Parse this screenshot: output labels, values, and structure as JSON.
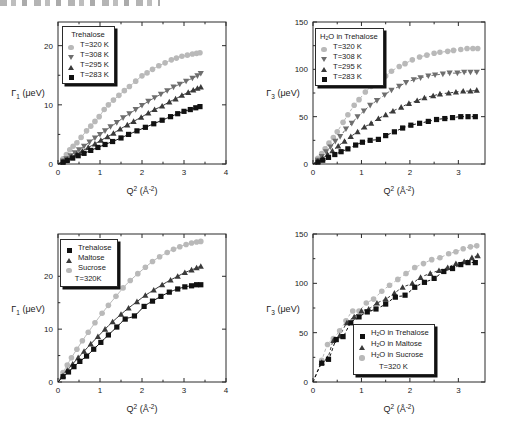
{
  "figure": {
    "header_artifact": "scan-edge-text",
    "panel_count": 4
  },
  "colors": {
    "c283": "#111111",
    "c295": "#3a3a3a",
    "c308": "#6e6e6e",
    "c320": "#b9b9b9",
    "axis": "#2a2a2a",
    "trehalose": "#111111",
    "maltose": "#3a3a3a",
    "sucrose": "#b9b9b9"
  },
  "axis_labels": {
    "x": "Q² (Å⁻²)",
    "x_base": "Q",
    "x_sup": "2",
    "x_unit_open": " (Å",
    "x_unit_sup": "-2",
    "x_unit_close": ")",
    "y_gamma1": "Γ₁ (μeV)",
    "y_gamma3": "Γ₃ (μeV)",
    "y_gamma_base": "Γ",
    "y_sub_1": "1",
    "y_sub_3": "3",
    "y_unit": " (μeV)"
  },
  "chart_data": [
    {
      "id": "panel-top-left",
      "type": "scatter",
      "title": "",
      "xlabel": "Q² (Å⁻²)",
      "ylabel": "Γ₁ (μeV)",
      "xlim": [
        0,
        4
      ],
      "ylim": [
        0,
        24
      ],
      "xticks": [
        0,
        1,
        2,
        3,
        4
      ],
      "yticks": [
        0,
        10,
        20
      ],
      "grid": false,
      "fit_style": "solid",
      "legend_position": "top-left",
      "legend_title": "Trehalose",
      "series": [
        {
          "name": "T=320 K",
          "marker": "circle",
          "color": "#b9b9b9",
          "x": [
            0.12,
            0.2,
            0.28,
            0.36,
            0.45,
            0.55,
            0.68,
            0.78,
            0.88,
            0.98,
            1.1,
            1.2,
            1.32,
            1.45,
            1.58,
            1.7,
            1.85,
            2.0,
            2.12,
            2.25,
            2.4,
            2.55,
            2.7,
            2.82,
            2.95,
            3.08,
            3.2,
            3.3,
            3.38
          ],
          "y": [
            0.9,
            1.6,
            2.4,
            3.0,
            3.6,
            4.5,
            5.6,
            6.4,
            7.2,
            8.0,
            9.2,
            10.0,
            10.8,
            11.6,
            12.4,
            13.1,
            14.0,
            14.9,
            15.4,
            16.0,
            16.6,
            17.1,
            17.6,
            17.9,
            18.2,
            18.4,
            18.6,
            18.7,
            18.8
          ]
        },
        {
          "name": "T=308 K",
          "marker": "dtriangle",
          "color": "#6e6e6e",
          "x": [
            0.12,
            0.2,
            0.3,
            0.4,
            0.5,
            0.62,
            0.75,
            0.88,
            1.0,
            1.12,
            1.25,
            1.4,
            1.55,
            1.7,
            1.85,
            2.0,
            2.15,
            2.3,
            2.45,
            2.6,
            2.75,
            2.9,
            3.05,
            3.2,
            3.32,
            3.4
          ],
          "y": [
            0.5,
            0.9,
            1.4,
            1.9,
            2.4,
            3.0,
            3.7,
            4.4,
            5.0,
            5.6,
            6.3,
            7.0,
            7.8,
            8.5,
            9.2,
            9.9,
            10.6,
            11.2,
            11.8,
            12.4,
            13.0,
            13.5,
            14.0,
            14.5,
            14.9,
            15.3
          ]
        },
        {
          "name": "T=295 K",
          "marker": "utriangle",
          "color": "#3a3a3a",
          "x": [
            0.12,
            0.22,
            0.32,
            0.45,
            0.58,
            0.72,
            0.88,
            1.02,
            1.18,
            1.32,
            1.48,
            1.65,
            1.8,
            1.98,
            2.15,
            2.3,
            2.48,
            2.65,
            2.8,
            2.95,
            3.1,
            3.22,
            3.32,
            3.4
          ],
          "y": [
            0.4,
            0.8,
            1.2,
            1.7,
            2.2,
            2.8,
            3.4,
            4.0,
            4.6,
            5.2,
            5.9,
            6.6,
            7.2,
            7.9,
            8.6,
            9.2,
            9.8,
            10.5,
            11.0,
            11.6,
            12.1,
            12.5,
            12.8,
            13.0
          ]
        },
        {
          "name": "T=283 K",
          "marker": "square",
          "color": "#111111",
          "x": [
            0.12,
            0.22,
            0.35,
            0.48,
            0.62,
            0.78,
            0.95,
            1.12,
            1.3,
            1.5,
            1.68,
            1.88,
            2.08,
            2.28,
            2.48,
            2.68,
            2.85,
            3.0,
            3.15,
            3.28,
            3.38
          ],
          "y": [
            0.3,
            0.6,
            1.0,
            1.4,
            1.8,
            2.3,
            2.8,
            3.3,
            3.8,
            4.4,
            5.0,
            5.6,
            6.2,
            6.8,
            7.4,
            8.0,
            8.5,
            8.9,
            9.2,
            9.5,
            9.7
          ]
        }
      ]
    },
    {
      "id": "panel-top-right",
      "type": "scatter",
      "title": "",
      "xlabel": "Q² (Å⁻²)",
      "ylabel": "Γ₃ (μeV)",
      "xlim": [
        0,
        3.55
      ],
      "ylim": [
        0,
        150
      ],
      "xticks": [
        0,
        1,
        2,
        3
      ],
      "yticks": [
        0,
        50,
        100,
        150
      ],
      "grid": false,
      "fit_style": "dashed",
      "legend_position": "top-left",
      "legend_title": "H₂O in Trehalose",
      "series": [
        {
          "name": "T=320 K",
          "marker": "circle",
          "color": "#b9b9b9",
          "x": [
            0.1,
            0.18,
            0.25,
            0.33,
            0.42,
            0.5,
            0.62,
            0.72,
            0.85,
            0.95,
            1.08,
            1.2,
            1.35,
            1.5,
            1.62,
            1.78,
            1.9,
            2.05,
            2.2,
            2.35,
            2.5,
            2.62,
            2.78,
            2.9,
            3.05,
            3.18,
            3.3,
            3.4
          ],
          "y": [
            6,
            11,
            16,
            22,
            28,
            34,
            44,
            52,
            62,
            68,
            76,
            82,
            88,
            93,
            98,
            103,
            106,
            110,
            113,
            115,
            117,
            118,
            119,
            120,
            121,
            122,
            122,
            122
          ]
        },
        {
          "name": "T=308 K",
          "marker": "dtriangle",
          "color": "#6e6e6e",
          "x": [
            0.1,
            0.18,
            0.27,
            0.36,
            0.46,
            0.56,
            0.68,
            0.8,
            0.92,
            1.05,
            1.18,
            1.32,
            1.48,
            1.62,
            1.78,
            1.92,
            2.08,
            2.22,
            2.38,
            2.52,
            2.68,
            2.82,
            2.98,
            3.12,
            3.25,
            3.38
          ],
          "y": [
            4,
            8,
            13,
            18,
            24,
            29,
            37,
            43,
            50,
            56,
            62,
            67,
            73,
            78,
            82,
            86,
            89,
            91,
            93,
            94,
            95,
            96,
            96,
            97,
            97,
            97
          ]
        },
        {
          "name": "T=295 K",
          "marker": "utriangle",
          "color": "#3a3a3a",
          "x": [
            0.1,
            0.2,
            0.3,
            0.4,
            0.52,
            0.65,
            0.78,
            0.92,
            1.06,
            1.2,
            1.35,
            1.5,
            1.65,
            1.82,
            1.98,
            2.15,
            2.3,
            2.48,
            2.62,
            2.8,
            2.95,
            3.1,
            3.25,
            3.38
          ],
          "y": [
            3,
            6,
            10,
            14,
            19,
            24,
            29,
            34,
            39,
            43,
            48,
            52,
            56,
            60,
            64,
            67,
            70,
            72,
            74,
            75,
            76,
            77,
            77,
            78
          ]
        },
        {
          "name": "T=283 K",
          "marker": "square",
          "color": "#111111",
          "x": [
            0.1,
            0.2,
            0.32,
            0.45,
            0.58,
            0.72,
            0.88,
            1.02,
            1.18,
            1.35,
            1.5,
            1.68,
            1.85,
            2.02,
            2.2,
            2.38,
            2.55,
            2.72,
            2.88,
            3.05,
            3.2,
            3.35
          ],
          "y": [
            2,
            4,
            7,
            10,
            13,
            16,
            20,
            23,
            25,
            26,
            30,
            34,
            38,
            41,
            43,
            45,
            47,
            48,
            49,
            50,
            50,
            50
          ]
        }
      ]
    },
    {
      "id": "panel-bottom-left",
      "type": "scatter",
      "title": "",
      "xlabel": "Q² (Å⁻²)",
      "ylabel": "Γ₁ (μeV)",
      "xlim": [
        0,
        4
      ],
      "ylim": [
        0,
        28
      ],
      "xticks": [
        0,
        1,
        2,
        3,
        4
      ],
      "yticks": [
        0,
        10,
        20
      ],
      "grid": false,
      "fit_style": "solid",
      "legend_position": "top-left",
      "legend_footer": "T=320K",
      "series": [
        {
          "name": "Sucrose",
          "marker": "circle",
          "color": "#b9b9b9",
          "x": [
            0.12,
            0.22,
            0.32,
            0.45,
            0.58,
            0.72,
            0.88,
            1.05,
            1.2,
            1.38,
            1.55,
            1.72,
            1.9,
            2.08,
            2.25,
            2.42,
            2.6,
            2.75,
            2.9,
            3.05,
            3.18,
            3.3,
            3.4
          ],
          "y": [
            1.8,
            3.2,
            4.6,
            6.2,
            7.8,
            9.4,
            11.2,
            13.0,
            14.5,
            16.2,
            17.8,
            19.2,
            20.5,
            21.7,
            22.8,
            23.7,
            24.5,
            25.1,
            25.6,
            26.0,
            26.3,
            26.5,
            26.6
          ]
        },
        {
          "name": "Maltose",
          "marker": "utriangle",
          "color": "#3a3a3a",
          "x": [
            0.12,
            0.22,
            0.35,
            0.48,
            0.62,
            0.78,
            0.95,
            1.12,
            1.3,
            1.5,
            1.68,
            1.88,
            2.08,
            2.28,
            2.48,
            2.68,
            2.85,
            3.02,
            3.18,
            3.3,
            3.4
          ],
          "y": [
            1.2,
            2.2,
            3.4,
            4.6,
            5.8,
            7.2,
            8.6,
            10.0,
            11.4,
            12.8,
            14.0,
            15.2,
            16.4,
            17.4,
            18.4,
            19.3,
            20.0,
            20.7,
            21.2,
            21.6,
            21.9
          ]
        },
        {
          "name": "Trehalose",
          "marker": "square",
          "color": "#111111",
          "x": [
            0.12,
            0.25,
            0.38,
            0.52,
            0.68,
            0.85,
            1.02,
            1.2,
            1.4,
            1.6,
            1.82,
            2.05,
            2.25,
            2.45,
            2.65,
            2.85,
            3.02,
            3.18,
            3.3,
            3.4
          ],
          "y": [
            1.0,
            1.9,
            2.9,
            3.9,
            4.9,
            6.2,
            7.5,
            8.9,
            10.4,
            11.9,
            12.5,
            14.3,
            15.3,
            16.2,
            17.0,
            17.6,
            18.0,
            18.2,
            18.4,
            18.4
          ]
        }
      ]
    },
    {
      "id": "panel-bottom-right",
      "type": "scatter",
      "title": "",
      "xlabel": "Q² (Å⁻²)",
      "ylabel": "Γ₃ (μeV)",
      "xlim": [
        0,
        3.55
      ],
      "ylim": [
        0,
        150
      ],
      "xticks": [
        0,
        1,
        2,
        3
      ],
      "yticks": [
        0,
        50,
        100,
        150
      ],
      "grid": false,
      "fit_style": "dashed",
      "legend_position": "bottom-right",
      "legend_footer": "T=320 K",
      "series": [
        {
          "name": "H₂O in Sucrose",
          "marker": "circle",
          "color": "#b9b9b9",
          "x": [
            0.18,
            0.3,
            0.42,
            0.55,
            0.68,
            0.82,
            0.95,
            1.1,
            1.25,
            1.42,
            1.58,
            1.75,
            1.92,
            2.1,
            2.28,
            2.45,
            2.62,
            2.8,
            2.95,
            3.1,
            3.25,
            3.38
          ],
          "y": [
            22,
            38,
            44,
            52,
            62,
            72,
            72,
            80,
            84,
            92,
            98,
            104,
            110,
            116,
            120,
            124,
            126,
            130,
            132,
            135,
            137,
            138
          ]
        },
        {
          "name": "H₂O in Maltose",
          "marker": "utriangle",
          "color": "#3a3a3a",
          "x": [
            0.18,
            0.3,
            0.42,
            0.55,
            0.7,
            0.85,
            1.0,
            1.15,
            1.32,
            1.5,
            1.68,
            1.85,
            2.05,
            2.22,
            2.42,
            2.6,
            2.78,
            2.95,
            3.12,
            3.28,
            3.4
          ],
          "y": [
            20,
            24,
            42,
            47,
            60,
            66,
            72,
            74,
            80,
            84,
            90,
            96,
            100,
            106,
            110,
            113,
            116,
            120,
            122,
            126,
            128
          ]
        },
        {
          "name": "H₂O in Trehalose",
          "marker": "square",
          "color": "#111111",
          "x": [
            0.18,
            0.32,
            0.48,
            0.62,
            0.78,
            0.95,
            1.12,
            1.3,
            1.5,
            1.7,
            1.9,
            2.1,
            2.3,
            2.5,
            2.7,
            2.88,
            3.05,
            3.2,
            3.35
          ],
          "y": [
            19,
            23,
            43,
            46,
            60,
            66,
            71,
            74,
            79,
            86,
            88,
            96,
            101,
            105,
            112,
            115,
            119,
            121,
            121
          ]
        }
      ]
    }
  ],
  "panels": {
    "top_left": {
      "legend": {
        "title": "Trehalose",
        "rows": [
          {
            "marker": "circle",
            "label": "T=320 K"
          },
          {
            "marker": "dtriangle",
            "label": "T=308 K"
          },
          {
            "marker": "utriangle",
            "label": "T=295 K"
          },
          {
            "marker": "square",
            "label": "T=283 K"
          }
        ]
      },
      "yticks": [
        "0",
        "10",
        "20"
      ],
      "xticks": [
        "0",
        "1",
        "2",
        "3",
        "4"
      ]
    },
    "top_right": {
      "legend": {
        "title_pre": "H",
        "title_sub": "2",
        "title_post": "O in Trehalose",
        "title": "H₂O in Trehalose",
        "rows": [
          {
            "marker": "circle",
            "label": "T=320 K"
          },
          {
            "marker": "dtriangle",
            "label": "T=308 K"
          },
          {
            "marker": "utriangle",
            "label": "T=295 K"
          },
          {
            "marker": "square",
            "label": "T=283 K"
          }
        ]
      },
      "yticks": [
        "0",
        "50",
        "100",
        "150"
      ],
      "xticks": [
        "0",
        "1",
        "2",
        "3"
      ]
    },
    "bottom_left": {
      "legend": {
        "rows": [
          {
            "marker": "square",
            "label": "Trehalose"
          },
          {
            "marker": "utriangle",
            "label": "Maltose"
          },
          {
            "marker": "circle",
            "label": "Sucrose"
          }
        ],
        "footer": "T=320K"
      },
      "yticks": [
        "0",
        "10",
        "20"
      ],
      "xticks": [
        "0",
        "1",
        "2",
        "3",
        "4"
      ]
    },
    "bottom_right": {
      "legend": {
        "rows": [
          {
            "marker": "square",
            "label_pre": "H",
            "label_sub": "2",
            "label_post": "O in Trehalose",
            "label": "H₂O in Trehalose"
          },
          {
            "marker": "utriangle",
            "label_pre": "H",
            "label_sub": "2",
            "label_post": "O in Maltose",
            "label": "H₂O in Maltose"
          },
          {
            "marker": "circle",
            "label_pre": "H",
            "label_sub": "2",
            "label_post": "O in Sucrose",
            "label": "H₂O in Sucrose"
          }
        ],
        "footer": "T=320 K"
      },
      "yticks": [
        "0",
        "50",
        "100",
        "150"
      ],
      "xticks": [
        "0",
        "1",
        "2",
        "3"
      ]
    }
  }
}
